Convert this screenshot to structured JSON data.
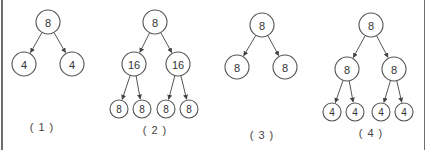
{
  "diagram": {
    "title": "",
    "colors": {
      "stroke": "#555555",
      "text": "#333333",
      "border": "#6e6e6e",
      "background": "#ffffff"
    },
    "trees": [
      {
        "label": "( 1 )",
        "label_pos": [
          42,
          131
        ],
        "nodes": [
          {
            "id": "r",
            "value": "8",
            "x": 48,
            "y": 22,
            "r": 12
          },
          {
            "id": "a",
            "value": "4",
            "x": 24,
            "y": 64,
            "r": 12
          },
          {
            "id": "b",
            "value": "4",
            "x": 72,
            "y": 64,
            "r": 12
          }
        ],
        "edges": [
          [
            "r",
            "a"
          ],
          [
            "r",
            "b"
          ]
        ]
      },
      {
        "label": "( 2 )",
        "label_pos": [
          155,
          134
        ],
        "nodes": [
          {
            "id": "r",
            "value": "8",
            "x": 155,
            "y": 22,
            "r": 12
          },
          {
            "id": "a",
            "value": "16",
            "x": 134,
            "y": 64,
            "r": 12
          },
          {
            "id": "b",
            "value": "16",
            "x": 178,
            "y": 64,
            "r": 12
          },
          {
            "id": "a1",
            "value": "8",
            "x": 119,
            "y": 109,
            "r": 9
          },
          {
            "id": "a2",
            "value": "8",
            "x": 142,
            "y": 109,
            "r": 9
          },
          {
            "id": "b1",
            "value": "8",
            "x": 166,
            "y": 109,
            "r": 9
          },
          {
            "id": "b2",
            "value": "8",
            "x": 189,
            "y": 109,
            "r": 9
          }
        ],
        "edges": [
          [
            "r",
            "a"
          ],
          [
            "r",
            "b"
          ],
          [
            "a",
            "a1"
          ],
          [
            "a",
            "a2"
          ],
          [
            "b",
            "b1"
          ],
          [
            "b",
            "b2"
          ]
        ]
      },
      {
        "label": "( 3 )",
        "label_pos": [
          262,
          139
        ],
        "nodes": [
          {
            "id": "r",
            "value": "8",
            "x": 262,
            "y": 25,
            "r": 12
          },
          {
            "id": "a",
            "value": "8",
            "x": 237,
            "y": 67,
            "r": 12
          },
          {
            "id": "b",
            "value": "8",
            "x": 285,
            "y": 67,
            "r": 12
          }
        ],
        "edges": [
          [
            "r",
            "a"
          ],
          [
            "r",
            "b"
          ]
        ]
      },
      {
        "label": "( 4 )",
        "label_pos": [
          371,
          137
        ],
        "nodes": [
          {
            "id": "r",
            "value": "8",
            "x": 371,
            "y": 25,
            "r": 12
          },
          {
            "id": "a",
            "value": "8",
            "x": 347,
            "y": 69,
            "r": 12
          },
          {
            "id": "b",
            "value": "8",
            "x": 394,
            "y": 69,
            "r": 12
          },
          {
            "id": "a1",
            "value": "4",
            "x": 332,
            "y": 112,
            "r": 9
          },
          {
            "id": "a2",
            "value": "4",
            "x": 355,
            "y": 112,
            "r": 9
          },
          {
            "id": "b1",
            "value": "4",
            "x": 381,
            "y": 112,
            "r": 9
          },
          {
            "id": "b2",
            "value": "4",
            "x": 404,
            "y": 112,
            "r": 9
          }
        ],
        "edges": [
          [
            "r",
            "a"
          ],
          [
            "r",
            "b"
          ],
          [
            "a",
            "a1"
          ],
          [
            "a",
            "a2"
          ],
          [
            "b",
            "b1"
          ],
          [
            "b",
            "b2"
          ]
        ]
      }
    ]
  }
}
